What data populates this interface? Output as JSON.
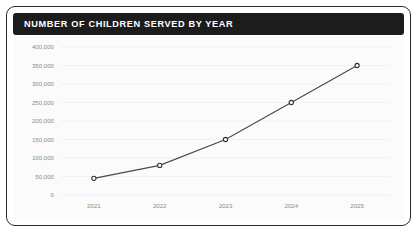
{
  "card": {
    "title": "NUMBER OF CHILDREN SERVED BY YEAR"
  },
  "colors": {
    "titlebar_background": "#1c1c1c",
    "title_text": "#ffffff",
    "card_border": "#2b2b2b",
    "plot_background": "#fbfbfb",
    "gridline": "#ececec",
    "line": "#4a4a4a",
    "marker_fill": "#ffffff",
    "marker_stroke": "#333333",
    "tick_label": "#8a8a8a"
  },
  "chart_data": {
    "type": "line",
    "title": "NUMBER OF CHILDREN SERVED BY YEAR",
    "xlabel": "",
    "ylabel": "",
    "categories": [
      "2021",
      "2022",
      "2023",
      "2024",
      "2025"
    ],
    "values": [
      45000,
      80000,
      150000,
      250000,
      350000
    ],
    "ylim": [
      0,
      400000
    ],
    "yticks": [
      0,
      50000,
      100000,
      150000,
      200000,
      250000,
      300000,
      350000,
      400000
    ],
    "ytick_labels": [
      "0",
      "50,000",
      "100,000",
      "150,000",
      "200,000",
      "250,000",
      "300,000",
      "350,000",
      "400,000"
    ],
    "xtick_labels": [
      "2021",
      "2022",
      "2023",
      "2024",
      "2025"
    ],
    "grid": true,
    "legend": false,
    "marker": "circle-open"
  }
}
